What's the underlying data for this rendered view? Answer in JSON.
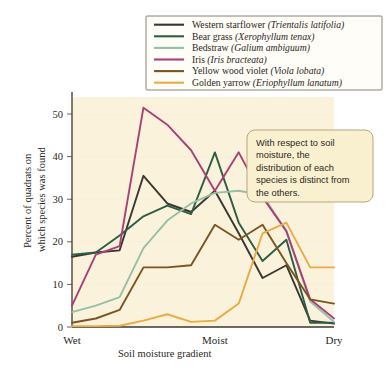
{
  "figure": {
    "plot_background": "#fbf2dc",
    "page_background": "#ffffff"
  },
  "callout": {
    "name": "annotation-callout",
    "lines": [
      "With respect to soil",
      "moisture, the",
      "distribution of each",
      "species is distinct from",
      "the others."
    ],
    "fill": "#f9f0cf",
    "border": "#b5a87e"
  },
  "legend": {
    "position": "top-right",
    "entries": [
      {
        "common": "Western starflower",
        "scientific": "(Trientalis latifolia)",
        "color": "#3a3630"
      },
      {
        "common": "Bear grass",
        "scientific": "(Xerophyllum tenax)",
        "color": "#2d5d42"
      },
      {
        "common": "Bedstraw",
        "scientific": "(Galium ambiguum)",
        "color": "#96c0a6"
      },
      {
        "common": "Iris",
        "scientific": "(Iris bracteata)",
        "color": "#a8407a"
      },
      {
        "common": "Yellow wood violet",
        "scientific": "(Viola lobata)",
        "color": "#7a5520"
      },
      {
        "common": "Golden yarrow",
        "scientific": "(Eriophyllum lanatum)",
        "color": "#e8ab45"
      }
    ]
  },
  "chart_data": {
    "type": "line",
    "title": "",
    "xlabel": "Soil moisture gradient",
    "ylabel": "Percent of quadrats on which species was found",
    "ylabel_lines": [
      "Percent of quadrats on",
      "which species was found"
    ],
    "ylim": [
      0,
      54
    ],
    "yticks": [
      0,
      10,
      20,
      30,
      40,
      50
    ],
    "xlim": [
      0,
      11
    ],
    "x": [
      0,
      1,
      2,
      3,
      4,
      5,
      6,
      7,
      8,
      9,
      10,
      11
    ],
    "category_ticks": [
      {
        "label": "Wet",
        "x": 0
      },
      {
        "label": "Moist",
        "x": 6
      },
      {
        "label": "Dry",
        "x": 11
      }
    ],
    "grid": "horizontal-faint",
    "legend_position": "top-right",
    "series": [
      {
        "name": "Western starflower",
        "scientific": "(Trientalis latifolia)",
        "color": "#3a3630",
        "values": [
          16.5,
          17.5,
          18.0,
          35.5,
          29.0,
          27.0,
          32.0,
          22.0,
          11.5,
          14.5,
          1.5,
          0.8
        ]
      },
      {
        "name": "Bear grass",
        "scientific": "(Xerophyllum tenax)",
        "color": "#2d5d42",
        "values": [
          17.0,
          17.5,
          21.5,
          26.0,
          28.5,
          26.5,
          41.0,
          24.5,
          15.5,
          20.5,
          1.0,
          1.0
        ]
      },
      {
        "name": "Bedstraw",
        "scientific": "(Galium ambiguum)",
        "color": "#96c0a6",
        "values": [
          3.5,
          5.0,
          7.0,
          18.5,
          25.0,
          29.0,
          31.5,
          32.0,
          31.0,
          22.5,
          6.0,
          1.2
        ]
      },
      {
        "name": "Iris",
        "scientific": "(Iris bracteata)",
        "color": "#a8407a",
        "values": [
          5.0,
          17.0,
          19.0,
          51.5,
          47.5,
          41.5,
          32.0,
          41.0,
          30.5,
          22.5,
          6.5,
          2.0
        ]
      },
      {
        "name": "Yellow wood violet",
        "scientific": "(Viola lobata)",
        "color": "#7a5520",
        "values": [
          1.0,
          2.0,
          4.0,
          14.0,
          14.0,
          14.5,
          24.0,
          20.5,
          24.0,
          15.0,
          6.5,
          5.5
        ]
      },
      {
        "name": "Golden yarrow",
        "scientific": "(Eriophyllum lanatum)",
        "color": "#e8ab45",
        "values": [
          0.2,
          0.2,
          0.3,
          1.5,
          3.0,
          1.2,
          1.5,
          5.5,
          22.0,
          24.5,
          14.0,
          14.0
        ]
      }
    ]
  }
}
